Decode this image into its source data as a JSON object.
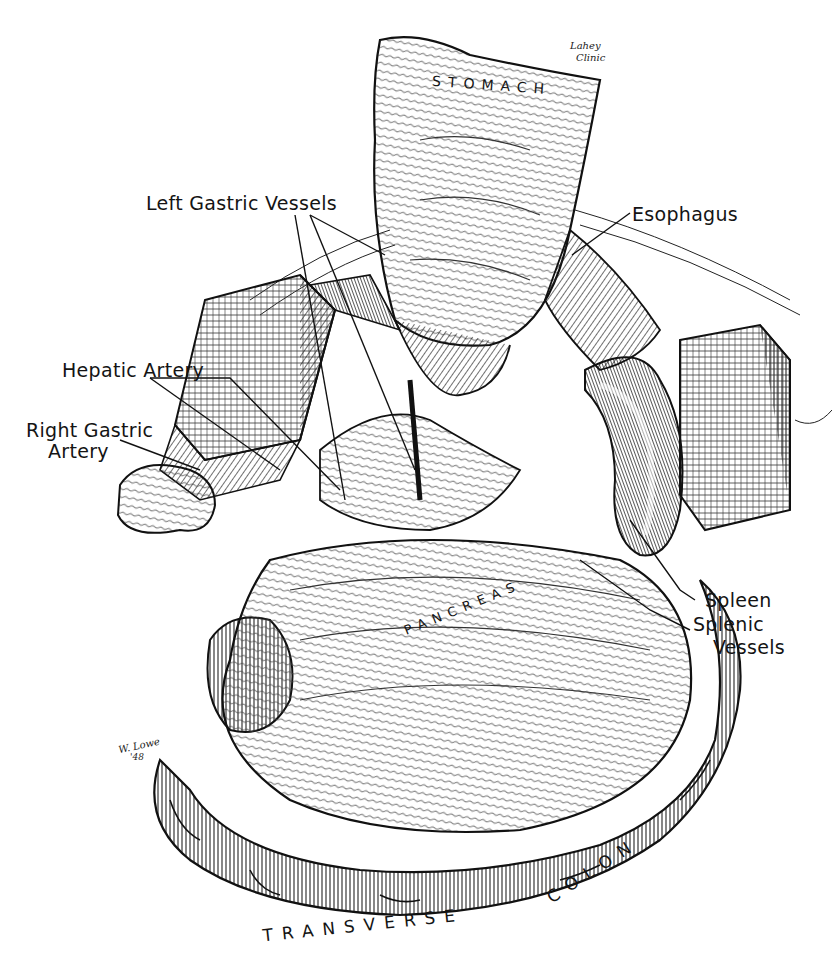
{
  "figure": {
    "type": "surgical anatomical illustration (pen and ink)",
    "credit": {
      "line1": "Lahey",
      "line2": "Clinic"
    },
    "artist_signature": {
      "line1": "W. Lowe",
      "line2": "'48"
    },
    "organ_captions": {
      "stomach": "STOMACH",
      "pancreas": "PANCREAS",
      "transverse": "TRANSVERSE",
      "colon": "COLON"
    },
    "labels": [
      {
        "id": "left-gastric-vessels",
        "text": "Left Gastric Vessels"
      },
      {
        "id": "esophagus",
        "text": "Esophagus"
      },
      {
        "id": "hepatic-artery",
        "text": "Hepatic Artery"
      },
      {
        "id": "right-gastric-artery",
        "line1": "Right Gastric",
        "line2": "Artery"
      },
      {
        "id": "spleen",
        "text": "Spleen"
      },
      {
        "id": "splenic-vessels",
        "line1": "Splenic",
        "line2": "Vessels"
      }
    ],
    "colors": {
      "ink": "#141414",
      "paper": "#ffffff"
    }
  }
}
